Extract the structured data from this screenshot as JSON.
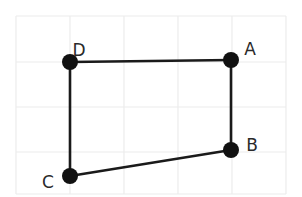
{
  "diagram": {
    "type": "quadrilateral-on-grid",
    "grid": {
      "x_lines": [
        16,
        70,
        124,
        178,
        232,
        286
      ],
      "y_lines": [
        16,
        62,
        107,
        152,
        194
      ],
      "color": "#ececec"
    },
    "points": [
      {
        "id": "A",
        "label": "A",
        "x": 231,
        "y": 60,
        "label_x": 250,
        "label_y": 49
      },
      {
        "id": "B",
        "label": "B",
        "x": 231,
        "y": 150,
        "label_x": 252,
        "label_y": 145
      },
      {
        "id": "C",
        "label": "C",
        "x": 70,
        "y": 176,
        "label_x": 48,
        "label_y": 182
      },
      {
        "id": "D",
        "label": "D",
        "x": 70,
        "y": 62,
        "label_x": 79,
        "label_y": 50
      }
    ],
    "edges": [
      {
        "from": "D",
        "to": "A"
      },
      {
        "from": "A",
        "to": "B"
      },
      {
        "from": "B",
        "to": "C"
      },
      {
        "from": "C",
        "to": "D"
      }
    ],
    "colors": {
      "edge": "#1a1a1a",
      "vertex": "#111111",
      "label": "#2a2a2a"
    }
  }
}
